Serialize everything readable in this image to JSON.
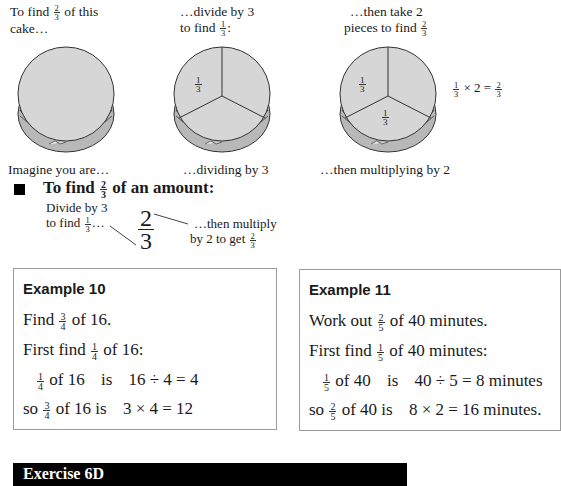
{
  "cakes": [
    {
      "caption_top": [
        "To find",
        "2/3",
        "of this",
        "cake…"
      ],
      "caption_top_line1_pre": "To find",
      "caption_top_line1_frac": {
        "num": "2",
        "den": "3"
      },
      "caption_top_line1_post": "of this",
      "caption_top_line2": "cake…",
      "caption_bottom": "Imagine you are…",
      "slices": 0,
      "labels": []
    },
    {
      "caption_top_line1": "…divide by 3",
      "caption_top_line2_pre": "to find",
      "caption_top_line2_frac": {
        "num": "1",
        "den": "3"
      },
      "caption_top_line2_post": ":",
      "caption_bottom": "…dividing by 3",
      "slices": 3,
      "labels": [
        {
          "num": "1",
          "den": "3"
        }
      ]
    },
    {
      "caption_top_line1": "…then take 2",
      "caption_top_line2_pre": "pieces to find",
      "caption_top_line2_frac": {
        "num": "2",
        "den": "3"
      },
      "caption_bottom": "…then multiplying by 2",
      "slices": 3,
      "labels": [
        {
          "num": "1",
          "den": "3"
        },
        {
          "num": "1",
          "den": "3"
        }
      ],
      "equation": {
        "a": {
          "num": "1",
          "den": "3"
        },
        "op": "× 2 =",
        "b": {
          "num": "2",
          "den": "3"
        }
      }
    }
  ],
  "rule": {
    "heading_pre": "To find",
    "heading_frac": {
      "num": "2",
      "den": "3"
    },
    "heading_post": "of an amount:",
    "left_note_line1": "Divide by 3",
    "left_note_line2_pre": "to find",
    "left_note_line2_frac": {
      "num": "1",
      "den": "3"
    },
    "left_note_line2_post": "…",
    "big_frac": {
      "num": "2",
      "den": "3"
    },
    "right_note_line1": "…then multiply",
    "right_note_line2_pre": "by 2 to get",
    "right_note_line2_frac": {
      "num": "2",
      "den": "3"
    }
  },
  "examples": [
    {
      "title": "Example 10",
      "lines": [
        {
          "pre": "Find",
          "frac": {
            "num": "3",
            "den": "4"
          },
          "post": "of 16."
        },
        {
          "pre": "First find",
          "frac": {
            "num": "1",
            "den": "4"
          },
          "post": "of 16:"
        },
        {
          "pre": "",
          "frac": {
            "num": "1",
            "den": "4"
          },
          "post": "of 16",
          "mid": "is",
          "calc": "16 ÷ 4 = 4"
        },
        {
          "pre": "so",
          "frac": {
            "num": "3",
            "den": "4"
          },
          "post": "of 16 is",
          "calc": "3 × 4 = 12"
        }
      ]
    },
    {
      "title": "Example 11",
      "lines": [
        {
          "pre": "Work out",
          "frac": {
            "num": "2",
            "den": "5"
          },
          "post": "of 40 minutes."
        },
        {
          "pre": "First find",
          "frac": {
            "num": "1",
            "den": "5"
          },
          "post": "of 40 minutes:"
        },
        {
          "pre": "",
          "frac": {
            "num": "1",
            "den": "5"
          },
          "post": "of 40",
          "mid": "is",
          "calc": "40 ÷ 5 = 8 minutes"
        },
        {
          "pre": "so",
          "frac": {
            "num": "2",
            "den": "5"
          },
          "post": "of 40 is",
          "calc": "8 × 2 = 16 minutes."
        }
      ]
    }
  ],
  "exercise": {
    "title": "Exercise 6D"
  },
  "colors": {
    "cake_top": "#d6d6d6",
    "cake_side": "#bdbdbd",
    "outline": "#333333",
    "box_border": "#9a9a9a",
    "bar": "#000000"
  }
}
